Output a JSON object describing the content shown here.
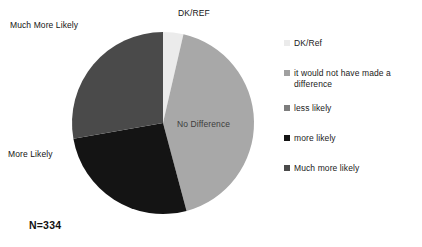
{
  "chart_data": {
    "type": "pie",
    "title": "",
    "sample_size_label": "N=334",
    "categories": [
      "DK/REF",
      "No Difference",
      "More Likely",
      "Much More Likely"
    ],
    "values": [
      3.6,
      42.2,
      26.4,
      16.7
    ],
    "units": "percent",
    "slices": [
      {
        "label": "DK/REF",
        "legend_label": "DK/Ref",
        "value": 3.6,
        "start_angle": 0,
        "sweep_angle": 13,
        "color": "#ebebeb",
        "callout": true
      },
      {
        "label": "No Difference",
        "legend_label": "it would not have made a difference",
        "value": 42.2,
        "start_angle": 13,
        "sweep_angle": 152,
        "color": "#a8a8a8",
        "callout": false
      },
      {
        "label": "More Likely",
        "legend_label": "more likely",
        "value": 26.4,
        "start_angle": 165,
        "sweep_angle": 95,
        "color": "#141414",
        "callout": true
      },
      {
        "label": "Much More Likely",
        "legend_label": "Much more likely",
        "value": 16.7,
        "start_angle": 260,
        "sweep_angle": 100,
        "color": "#4a4a4a",
        "callout": true
      }
    ],
    "legend_position": "right",
    "grid": false
  },
  "callouts": {
    "much_more_likely": "Much More Likely",
    "dk_ref": "DK/REF",
    "more_likely": "More Likely",
    "no_difference": "No Difference"
  },
  "caption": {
    "sample_size": "N=334"
  },
  "legend": {
    "items": [
      {
        "label": "DK/Ref",
        "color": "#ebebeb"
      },
      {
        "label": "it would not have made a difference",
        "color": "#a0a0a0"
      },
      {
        "label": "less likely",
        "color": "#7d7d7d"
      },
      {
        "label": "more likely",
        "color": "#141414"
      },
      {
        "label": "Much more likely",
        "color": "#4a4a4a"
      }
    ]
  }
}
